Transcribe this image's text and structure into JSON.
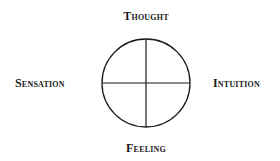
{
  "diagram": {
    "type": "four-function-compass",
    "labels": {
      "top": "Thought",
      "left": "Sensation",
      "right": "Intuition",
      "bottom": "Feeling"
    },
    "circle": {
      "cx": 146,
      "cy": 83,
      "r": 44,
      "stroke": "#1a1a1a"
    }
  }
}
